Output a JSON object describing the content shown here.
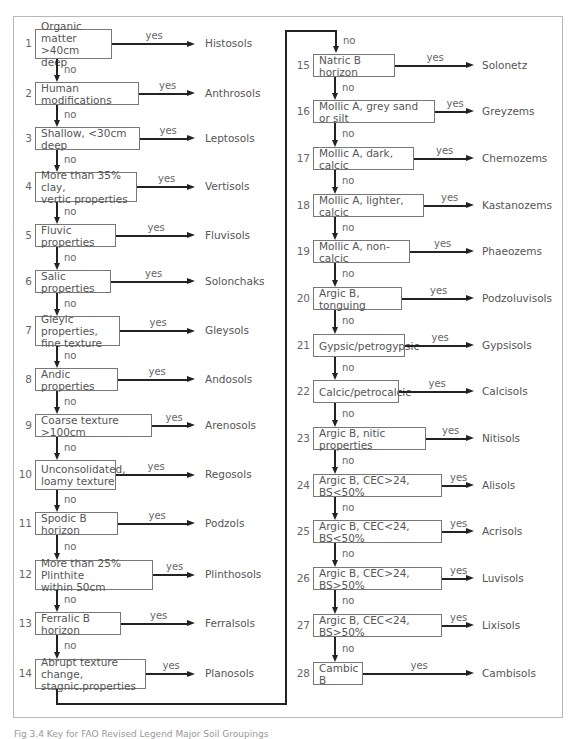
{
  "figure": {
    "caption": "Fig 3.4 Key for FAO Revised Legend Major Soil Groupings",
    "yes_label": "yes",
    "no_label": "no",
    "line_color": "#222222",
    "box_border_color": "#777777",
    "frame_color": "#b8b8b8"
  },
  "steps": [
    {
      "n": "1",
      "question": "Organic matter\n>40cm deep",
      "outcome": "Histosols",
      "col": 0,
      "top": 29,
      "h": 30,
      "w": 77
    },
    {
      "n": "2",
      "question": "Human modifications",
      "outcome": "Anthrosols",
      "col": 0,
      "top": 82,
      "h": 23,
      "w": 104
    },
    {
      "n": "3",
      "question": "Shallow, <30cm deep",
      "outcome": "Leptosols",
      "col": 0,
      "top": 127,
      "h": 23,
      "w": 105
    },
    {
      "n": "4",
      "question": "More than 35% clay,\nvertic properties",
      "outcome": "Vertisols",
      "col": 0,
      "top": 172,
      "h": 30,
      "w": 102
    },
    {
      "n": "5",
      "question": "Fluvic properties",
      "outcome": "Fluvisols",
      "col": 0,
      "top": 224,
      "h": 23,
      "w": 81
    },
    {
      "n": "6",
      "question": "Salic properties",
      "outcome": "Solonchaks",
      "col": 0,
      "top": 270,
      "h": 23,
      "w": 76
    },
    {
      "n": "7",
      "question": "Gleyic properties,\nfine texture",
      "outcome": "Gleysols",
      "col": 0,
      "top": 316,
      "h": 30,
      "w": 85
    },
    {
      "n": "8",
      "question": "Andic properties",
      "outcome": "Andosols",
      "col": 0,
      "top": 368,
      "h": 23,
      "w": 83
    },
    {
      "n": "9",
      "question": "Coarse texture >100cm",
      "outcome": "Arenosols",
      "col": 0,
      "top": 414,
      "h": 23,
      "w": 117
    },
    {
      "n": "10",
      "question": "Unconsolidated,\nloamy texture",
      "outcome": "Regosols",
      "col": 0,
      "top": 460,
      "h": 30,
      "w": 81
    },
    {
      "n": "11",
      "question": "Spodic B horizon",
      "outcome": "Podzols",
      "col": 0,
      "top": 512,
      "h": 23,
      "w": 83
    },
    {
      "n": "12",
      "question": "More than 25% Plinthite\nwithin 50cm",
      "outcome": "Plinthosols",
      "col": 0,
      "top": 560,
      "h": 30,
      "w": 118
    },
    {
      "n": "13",
      "question": "Ferralic B horizon",
      "outcome": "Ferralsols",
      "col": 0,
      "top": 612,
      "h": 23,
      "w": 86
    },
    {
      "n": "14",
      "question": "Abrupt texture change,\nstagnic.properties",
      "outcome": "Planosols",
      "col": 0,
      "top": 659,
      "h": 30,
      "w": 111
    },
    {
      "n": "15",
      "question": "Natric B horizon",
      "outcome": "Solonetz",
      "col": 1,
      "top": 54,
      "h": 23,
      "w": 82
    },
    {
      "n": "16",
      "question": "Mollic A, grey sand or silt",
      "outcome": "Greyzems",
      "col": 1,
      "top": 100,
      "h": 23,
      "w": 122
    },
    {
      "n": "17",
      "question": "Mollic A, dark, calcic",
      "outcome": "Chernozems",
      "col": 1,
      "top": 147,
      "h": 23,
      "w": 101
    },
    {
      "n": "18",
      "question": "Mollic A, lighter, calcic",
      "outcome": "Kastanozems",
      "col": 1,
      "top": 194,
      "h": 23,
      "w": 111
    },
    {
      "n": "19",
      "question": "Mollic A, non-calcic",
      "outcome": "Phaeozems",
      "col": 1,
      "top": 240,
      "h": 23,
      "w": 97
    },
    {
      "n": "20",
      "question": "Argic B, tonguing",
      "outcome": "Podzoluvisols",
      "col": 1,
      "top": 287,
      "h": 23,
      "w": 89
    },
    {
      "n": "21",
      "question": "Gypsic/petrogypsic",
      "outcome": "Gypsisols",
      "col": 1,
      "top": 334,
      "h": 23,
      "w": 92
    },
    {
      "n": "22",
      "question": "Calcic/petrocalcic",
      "outcome": "Calcisols",
      "col": 1,
      "top": 380,
      "h": 23,
      "w": 86
    },
    {
      "n": "23",
      "question": "Argic B, nitic properties",
      "outcome": "Nitisols",
      "col": 1,
      "top": 427,
      "h": 23,
      "w": 113
    },
    {
      "n": "24",
      "question": "Argic B, CEC>24, BS<50%",
      "outcome": "Alisols",
      "col": 1,
      "top": 474,
      "h": 23,
      "w": 129
    },
    {
      "n": "25",
      "question": "Argic B, CEC<24, BS<50%",
      "outcome": "Acrisols",
      "col": 1,
      "top": 520,
      "h": 23,
      "w": 129
    },
    {
      "n": "26",
      "question": "Argic B, CEC>24, BS>50%",
      "outcome": "Luvisols",
      "col": 1,
      "top": 567,
      "h": 23,
      "w": 129
    },
    {
      "n": "27",
      "question": "Argic B, CEC<24, BS>50%",
      "outcome": "Lixisols",
      "col": 1,
      "top": 614,
      "h": 23,
      "w": 129
    },
    {
      "n": "28",
      "question": "Cambic B",
      "outcome": "Cambisols",
      "col": 1,
      "top": 662,
      "h": 23,
      "w": 50
    }
  ]
}
